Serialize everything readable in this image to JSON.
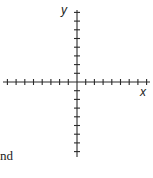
{
  "diagram": {
    "type": "coordinate-plane",
    "x_axis_label": "x",
    "y_axis_label": "y",
    "ticks_per_half_axis": 8,
    "tick_spacing_px": 8.7,
    "origin_px": [
      77,
      82
    ],
    "axis_color": "#2a2a2a"
  },
  "text_fragment": "nd"
}
